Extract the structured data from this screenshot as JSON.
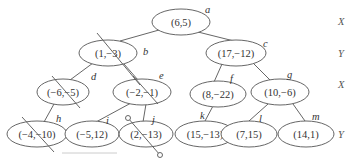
{
  "diagram": {
    "type": "kd-tree",
    "nodes": [
      {
        "id": "a",
        "point": "(6,5)",
        "cx": 181,
        "cy": 22,
        "rx": 29,
        "ry": 13,
        "lx": 205,
        "ly": 13
      },
      {
        "id": "b",
        "point": "(1,−3)",
        "cx": 108,
        "cy": 53,
        "rx": 29,
        "ry": 13,
        "lx": 143,
        "ly": 55
      },
      {
        "id": "c",
        "point": "(17,−12)",
        "cx": 236,
        "cy": 53,
        "rx": 30,
        "ry": 13,
        "lx": 263,
        "ly": 47
      },
      {
        "id": "d",
        "point": "(−6,−5)",
        "cx": 63,
        "cy": 92,
        "rx": 26,
        "ry": 13,
        "lx": 91,
        "ly": 80
      },
      {
        "id": "e",
        "point": "(−2,−1)",
        "cx": 142,
        "cy": 92,
        "rx": 29,
        "ry": 13,
        "lx": 159,
        "ly": 79
      },
      {
        "id": "f",
        "point": "(8,−22)",
        "cx": 218,
        "cy": 94,
        "rx": 28,
        "ry": 13,
        "lx": 230,
        "ly": 82
      },
      {
        "id": "g",
        "point": "(10,−6)",
        "cx": 280,
        "cy": 92,
        "rx": 29,
        "ry": 13,
        "lx": 287,
        "ly": 78
      },
      {
        "id": "h",
        "point": "(−4,−10)",
        "cx": 37,
        "cy": 134,
        "rx": 30,
        "ry": 13,
        "lx": 56,
        "ly": 122
      },
      {
        "id": "i",
        "point": "(−5,12)",
        "cx": 92,
        "cy": 134,
        "rx": 27,
        "ry": 13,
        "lx": 106,
        "ly": 124
      },
      {
        "id": "j",
        "point": "(2,−13)",
        "cx": 146,
        "cy": 134,
        "rx": 27,
        "ry": 13,
        "lx": 152,
        "ly": 123
      },
      {
        "id": "k",
        "point": "(15,−13)",
        "cx": 205,
        "cy": 134,
        "rx": 30,
        "ry": 13,
        "lx": 200,
        "ly": 119
      },
      {
        "id": "l",
        "point": "(7,15)",
        "cx": 249,
        "cy": 134,
        "rx": 28,
        "ry": 13,
        "lx": 259,
        "ly": 122
      },
      {
        "id": "m",
        "point": "(14,1)",
        "cx": 306,
        "cy": 134,
        "rx": 28,
        "ry": 13,
        "lx": 312,
        "ly": 120
      }
    ],
    "edges": [
      {
        "from": "a",
        "to": "b",
        "x1": 159,
        "y1": 30,
        "x2": 120,
        "y2": 41
      },
      {
        "from": "a",
        "to": "c",
        "x1": 198,
        "y1": 32,
        "x2": 234,
        "y2": 41
      },
      {
        "from": "b",
        "to": "d",
        "x1": 93,
        "y1": 63,
        "x2": 70,
        "y2": 80
      },
      {
        "from": "b",
        "to": "e",
        "x1": 124,
        "y1": 64,
        "x2": 138,
        "y2": 80
      },
      {
        "from": "c",
        "to": "f",
        "x1": 222,
        "y1": 64,
        "x2": 214,
        "y2": 82
      },
      {
        "from": "c",
        "to": "g",
        "x1": 254,
        "y1": 64,
        "x2": 270,
        "y2": 80
      },
      {
        "from": "d",
        "to": "h",
        "x1": 54,
        "y1": 104,
        "x2": 44,
        "y2": 122
      },
      {
        "from": "e",
        "to": "i",
        "x1": 131,
        "y1": 103,
        "x2": 96,
        "y2": 122
      },
      {
        "from": "e",
        "to": "j",
        "x1": 146,
        "y1": 104,
        "x2": 143,
        "y2": 122
      },
      {
        "from": "f",
        "to": "k",
        "x1": 213,
        "y1": 106,
        "x2": 205,
        "y2": 121
      },
      {
        "from": "g",
        "to": "l",
        "x1": 268,
        "y1": 104,
        "x2": 249,
        "y2": 121
      },
      {
        "from": "g",
        "to": "m",
        "x1": 293,
        "y1": 104,
        "x2": 305,
        "y2": 121
      }
    ],
    "strikes": [
      {
        "x1": 97,
        "y1": 33,
        "x2": 140,
        "y2": 85
      },
      {
        "x1": 52,
        "y1": 76,
        "x2": 80,
        "y2": 108
      },
      {
        "x1": 133,
        "y1": 76,
        "x2": 158,
        "y2": 104
      },
      {
        "x1": 22,
        "y1": 117,
        "x2": 54,
        "y2": 152
      }
    ],
    "probe": {
      "x1": 128,
      "y1": 118,
      "x2": 160,
      "y2": 155,
      "r": 2.5
    },
    "underline": {
      "x1": 62,
      "y1": 153,
      "x2": 117,
      "y2": 153
    },
    "axis_labels": [
      {
        "text": "X",
        "x": 338,
        "y": 25
      },
      {
        "text": "Y",
        "x": 338,
        "y": 57
      },
      {
        "text": "X",
        "x": 338,
        "y": 88
      },
      {
        "text": "Y",
        "x": 338,
        "y": 138
      }
    ],
    "colors": {
      "stroke": "#555555",
      "text": "#333333",
      "underline": "#cccccc"
    }
  }
}
